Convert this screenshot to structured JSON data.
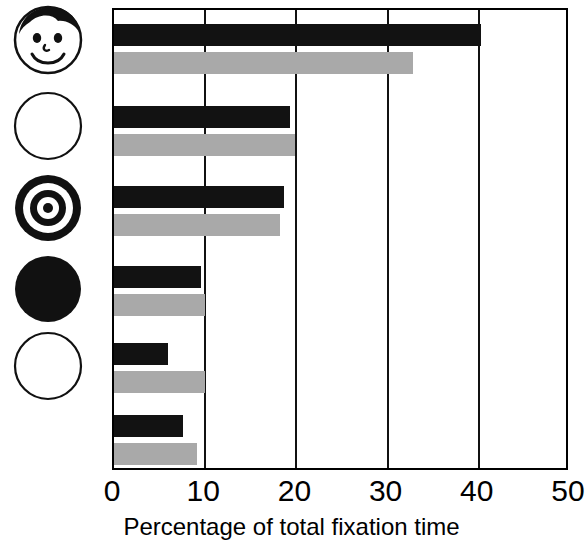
{
  "chart_data": {
    "type": "bar",
    "orientation": "horizontal",
    "title": "",
    "xlabel": "Percentage of total fixation time",
    "ylabel": "",
    "xlim": [
      0,
      50
    ],
    "xticks": [
      0,
      10,
      20,
      30,
      40,
      50
    ],
    "xtick_labels": [
      "0",
      "10",
      "20",
      "30",
      "40",
      "50"
    ],
    "grid": true,
    "grid_axis": "x",
    "legend": "none",
    "categories": [
      "face",
      "blank-circle-outline",
      "bullseye",
      "filled-black-circle",
      "plain-circle-outline",
      "unlabeled"
    ],
    "series": [
      {
        "name": "black",
        "color": "#121212",
        "values": [
          40.2,
          19.3,
          18.6,
          9.5,
          5.9,
          7.6
        ]
      },
      {
        "name": "gray",
        "color": "#a9a9a9",
        "values": [
          32.8,
          19.9,
          18.2,
          10.0,
          10.0,
          9.1
        ]
      }
    ]
  },
  "axis": {
    "x_title": "Percentage of total fixation time",
    "ticks": [
      {
        "label": "0",
        "value": 0
      },
      {
        "label": "10",
        "value": 10
      },
      {
        "label": "20",
        "value": 20
      },
      {
        "label": "30",
        "value": 30
      },
      {
        "label": "40",
        "value": 40
      },
      {
        "label": "50",
        "value": 50
      }
    ]
  },
  "icons": [
    {
      "name": "face-icon",
      "label": "smiling face stimulus"
    },
    {
      "name": "blank-circle-outline-icon",
      "label": "blank circle stimulus"
    },
    {
      "name": "bullseye-icon",
      "label": "concentric bullseye stimulus"
    },
    {
      "name": "filled-black-circle-icon",
      "label": "solid black circle stimulus"
    },
    {
      "name": "plain-circle-outline-icon",
      "label": "plain circle outline stimulus"
    }
  ],
  "colors": {
    "black_bar": "#121212",
    "gray_bar": "#a9a9a9",
    "axis": "#000000",
    "background": "#ffffff"
  }
}
